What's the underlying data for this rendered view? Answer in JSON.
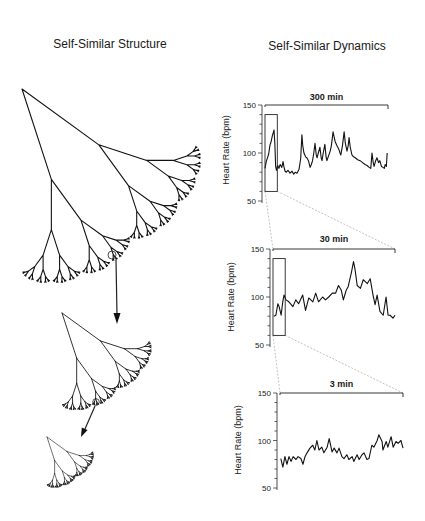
{
  "figure": {
    "left_title": "Self-Similar Structure",
    "right_title": "Self-Similar Dynamics"
  },
  "chart_data": [
    {
      "type": "line",
      "title": "",
      "span_label": "300 min",
      "xlabel": "",
      "ylabel": "Heart Rate (bpm)",
      "yticks": [
        150,
        100,
        50
      ],
      "ylim": [
        50,
        150
      ],
      "xlim": [
        0,
        300
      ],
      "x_unit": "min",
      "grid": false,
      "zoom_box": {
        "x": [
          0,
          30
        ],
        "y": [
          60,
          140
        ]
      },
      "x": [
        0,
        3,
        6,
        9,
        12,
        15,
        18,
        20,
        22,
        24,
        26,
        28,
        31,
        34,
        37,
        41,
        44,
        46,
        49,
        52,
        56,
        61,
        66,
        70,
        74,
        78,
        83,
        87,
        90,
        92,
        95,
        99,
        102,
        106,
        110,
        113,
        116,
        119,
        122,
        125,
        127,
        130,
        134,
        137,
        139,
        142,
        146,
        149,
        151,
        155,
        159,
        162,
        166,
        169,
        171,
        175,
        180,
        183,
        185,
        189,
        193,
        196,
        200,
        203,
        205,
        208,
        212,
        216,
        220,
        226,
        232,
        238,
        244,
        249,
        254,
        258,
        261,
        264,
        266,
        270,
        273,
        277,
        280,
        284,
        288,
        291,
        293,
        296,
        298
      ],
      "values": [
        84,
        91,
        95,
        99,
        108,
        112,
        118,
        121,
        124,
        110,
        86,
        82,
        87,
        84,
        88,
        85,
        91,
        86,
        81,
        80,
        82,
        79,
        81,
        78,
        80,
        79,
        83,
        94,
        119,
        108,
        100,
        96,
        95,
        92,
        85,
        88,
        92,
        100,
        110,
        98,
        95,
        100,
        106,
        95,
        92,
        100,
        109,
        96,
        92,
        97,
        102,
        108,
        122,
        116,
        112,
        108,
        104,
        100,
        98,
        108,
        122,
        110,
        102,
        108,
        116,
        106,
        98,
        96,
        95,
        93,
        92,
        90,
        88,
        87,
        85,
        84,
        100,
        90,
        86,
        92,
        95,
        90,
        92,
        86,
        85,
        84,
        88,
        86,
        100
      ]
    },
    {
      "type": "line",
      "title": "",
      "span_label": "30 min",
      "xlabel": "",
      "ylabel": "Heart Rate (bpm)",
      "yticks": [
        150,
        100,
        50
      ],
      "ylim": [
        50,
        150
      ],
      "xlim": [
        0,
        30
      ],
      "x_unit": "min",
      "grid": false,
      "zoom_box": {
        "x": [
          0,
          3
        ],
        "y": [
          60,
          140
        ]
      },
      "x": [
        0.2,
        0.7,
        1.2,
        1.5,
        2.0,
        2.4,
        2.7,
        3.2,
        3.9,
        4.9,
        5.6,
        6.3,
        7.3,
        8.0,
        8.8,
        9.8,
        10.5,
        11.2,
        12.2,
        12.9,
        13.7,
        14.6,
        15.4,
        16.1,
        16.8,
        17.3,
        18.0,
        18.5,
        19.3,
        19.8,
        20.2,
        20.7,
        21.5,
        22.2,
        23.2,
        23.9,
        24.6,
        25.1,
        25.6,
        26.3,
        27.1,
        27.8,
        28.3,
        28.8,
        29.5,
        30.0
      ],
      "values": [
        80,
        81,
        93,
        90,
        81,
        95,
        102,
        97,
        95,
        90,
        97,
        93,
        102,
        86,
        99,
        95,
        104,
        95,
        100,
        97,
        100,
        104,
        104,
        112,
        107,
        97,
        107,
        111,
        126,
        137,
        128,
        112,
        109,
        118,
        114,
        119,
        102,
        92,
        102,
        85,
        81,
        100,
        81,
        81,
        78,
        81
      ]
    },
    {
      "type": "line",
      "title": "",
      "span_label": "3 min",
      "xlabel": "",
      "ylabel": "Heart Rate (bpm)",
      "yticks": [
        150,
        100,
        50
      ],
      "ylim": [
        50,
        150
      ],
      "xlim": [
        0,
        3
      ],
      "x_unit": "min",
      "grid": false,
      "x": [
        0.02,
        0.07,
        0.12,
        0.17,
        0.22,
        0.27,
        0.32,
        0.39,
        0.44,
        0.51,
        0.56,
        0.61,
        0.66,
        0.73,
        0.8,
        0.85,
        0.9,
        0.95,
        1.02,
        1.07,
        1.15,
        1.2,
        1.27,
        1.32,
        1.39,
        1.44,
        1.51,
        1.56,
        1.63,
        1.68,
        1.76,
        1.8,
        1.88,
        1.93,
        2.0,
        2.05,
        2.12,
        2.17,
        2.24,
        2.29,
        2.37,
        2.41,
        2.49,
        2.51,
        2.59,
        2.63,
        2.71,
        2.76,
        2.83,
        2.88,
        2.95,
        3.0
      ],
      "values": [
        81,
        72,
        83,
        75,
        83,
        78,
        83,
        80,
        83,
        81,
        75,
        83,
        87,
        92,
        95,
        90,
        100,
        90,
        93,
        87,
        93,
        102,
        88,
        92,
        87,
        92,
        83,
        81,
        85,
        80,
        83,
        78,
        85,
        80,
        85,
        87,
        80,
        81,
        95,
        93,
        100,
        106,
        99,
        90,
        99,
        93,
        104,
        93,
        99,
        97,
        100,
        92
      ]
    }
  ]
}
